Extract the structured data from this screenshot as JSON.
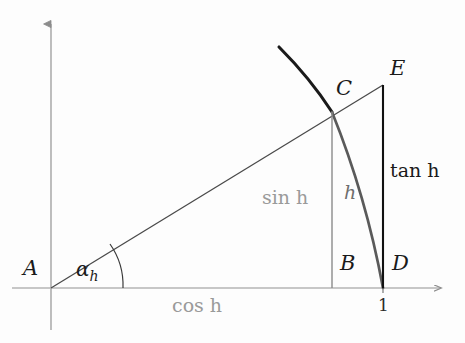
{
  "figure": {
    "kind": "trigonometric-unit-circle-diagram",
    "background_color": "#fdfdfd",
    "points": {
      "A": {
        "label": "A",
        "x": 51,
        "y": 288,
        "label_x": 23,
        "label_y": 258,
        "description": "origin"
      },
      "B": {
        "label": "B",
        "x": 332,
        "y": 288,
        "label_x": 340,
        "label_y": 253,
        "description": "foot of perpendicular from C"
      },
      "C": {
        "label": "C",
        "x": 332,
        "y": 112,
        "label_x": 336,
        "label_y": 78,
        "description": "point on unit circle"
      },
      "D": {
        "label": "D",
        "x": 383,
        "y": 288,
        "label_x": 392,
        "label_y": 253,
        "description": "unit point on x-axis"
      },
      "E": {
        "label": "E",
        "x": 383,
        "y": 85,
        "label_x": 390,
        "label_y": 58,
        "description": "top of tangent segment"
      }
    },
    "segment_labels": {
      "cos": {
        "text": "cos h",
        "color": "#9a9a9a",
        "x": 172,
        "y": 296
      },
      "sin": {
        "text": "sin h",
        "color": "#9a9a9a",
        "x": 262,
        "y": 188
      },
      "tan": {
        "text": "tan h",
        "color": "#1a1a1a",
        "x": 390,
        "y": 161
      },
      "arc": {
        "text": "h",
        "color": "#6e6e6e",
        "x": 344,
        "y": 183
      }
    },
    "angle": {
      "label_base": "α",
      "label_sub": "h",
      "label_x": 76,
      "label_y": 259,
      "arc_radius": 72,
      "color": "#1a1a1a"
    },
    "axis_ticks": [
      {
        "value": "1",
        "x": 378,
        "y": 297
      }
    ],
    "axes": {
      "x_axis_color": "#b0b0b0",
      "y_axis_color": "#8c8c8c",
      "x_arrow_tip_x": 443,
      "y_arrow_tip_y": 22,
      "origin_x": 51,
      "origin_y": 288
    },
    "strokes": {
      "unit_arc_color": "#1a1a1a",
      "chord_arc_color": "#555555",
      "hypotenuse_color": "#3a3a3a",
      "sin_line_color": "#808080",
      "tan_line_color": "#111111"
    }
  }
}
